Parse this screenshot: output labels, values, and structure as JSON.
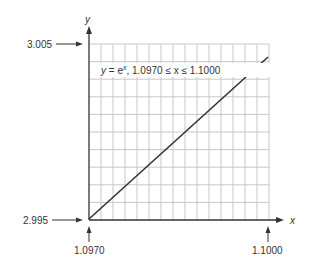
{
  "chart_data": {
    "type": "line",
    "title": "",
    "annotation": "y = e^x,   1.0970 ≤ x ≤ 1.1000",
    "annotation_parts": {
      "y": "y",
      "eq": " = e",
      "sup": "x",
      "range": ",   1.0970 ≤ x ≤ 1.1000"
    },
    "xlabel": "x",
    "ylabel": "y",
    "x_tick_labels": [
      "1.0970",
      "1.1000"
    ],
    "y_tick_labels": [
      "2.995",
      "3.005"
    ],
    "xlim": [
      1.097,
      1.1
    ],
    "ylim": [
      2.995,
      3.005
    ],
    "grid": true,
    "grid_columns": 15,
    "grid_rows": 10,
    "series": [
      {
        "name": "y = e^x",
        "x": [
          1.097,
          1.098,
          1.099,
          1.1
        ],
        "y": [
          2.9951,
          2.9981,
          3.0011,
          3.0042
        ]
      }
    ]
  },
  "labels": {
    "y_axis": "y",
    "x_axis": "x",
    "y_top": "3.005",
    "y_bottom": "2.995",
    "x_left": "1.0970",
    "x_right": "1.1000"
  },
  "colors": {
    "grid": "#c8c8c8",
    "axis": "#333333",
    "curve": "#333333"
  }
}
